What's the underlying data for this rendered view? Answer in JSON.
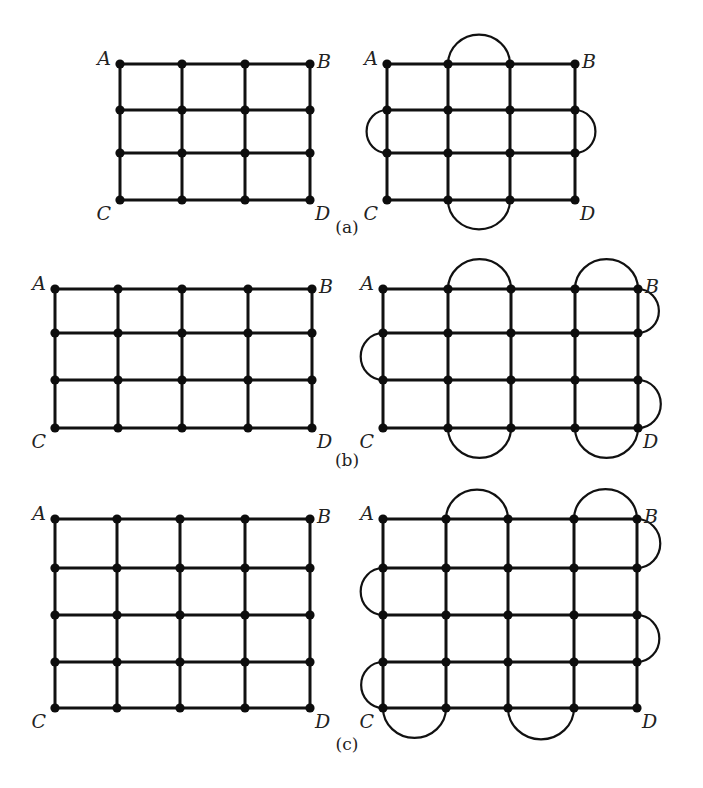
{
  "figure": {
    "diagrams": [
      {
        "id": "a",
        "caption": "(a)",
        "caption_pos": [
          347,
          233
        ],
        "grids": [
          {
            "side": "left",
            "xs": [
              120,
              182,
              245,
              310
            ],
            "ys": [
              64,
              110,
              153,
              200
            ],
            "labels": {
              "A": "A",
              "B": "B",
              "C": "C",
              "D": "D"
            },
            "arcs": []
          },
          {
            "side": "right",
            "xs": [
              387,
              448,
              510,
              575
            ],
            "ys": [
              64,
              110,
              153,
              200
            ],
            "labels": {
              "A": "A",
              "B": "B",
              "C": "C",
              "D": "D"
            },
            "arcs": [
              {
                "dir": "top",
                "row": 0,
                "from": 1,
                "to": 2
              },
              {
                "dir": "left",
                "col": 0,
                "from": 1,
                "to": 2
              },
              {
                "dir": "right",
                "col": 3,
                "from": 1,
                "to": 2
              },
              {
                "dir": "bottom",
                "row": 3,
                "from": 1,
                "to": 2
              }
            ]
          }
        ]
      },
      {
        "id": "b",
        "caption": "(b)",
        "caption_pos": [
          347,
          466
        ],
        "grids": [
          {
            "side": "left",
            "xs": [
              55,
              118,
              182,
              248,
              312
            ],
            "ys": [
              289,
              333,
              380,
              428
            ],
            "labels": {
              "A": "A",
              "B": "B",
              "C": "C",
              "D": "D"
            },
            "arcs": []
          },
          {
            "side": "right",
            "xs": [
              383,
              448,
              511,
              575,
              638
            ],
            "ys": [
              289,
              333,
              380,
              428
            ],
            "labels": {
              "A": "A",
              "B": "B",
              "C": "C",
              "D": "D"
            },
            "arcs": [
              {
                "dir": "top",
                "row": 0,
                "from": 1,
                "to": 2
              },
              {
                "dir": "top",
                "row": 0,
                "from": 3,
                "to": 4
              },
              {
                "dir": "left",
                "col": 0,
                "from": 1,
                "to": 2
              },
              {
                "dir": "right",
                "col": 4,
                "from": 0,
                "to": 1
              },
              {
                "dir": "right",
                "col": 4,
                "from": 2,
                "to": 3
              },
              {
                "dir": "bottom",
                "row": 3,
                "from": 1,
                "to": 2
              },
              {
                "dir": "bottom",
                "row": 3,
                "from": 3,
                "to": 4
              }
            ]
          }
        ]
      },
      {
        "id": "c",
        "caption": "(c)",
        "caption_pos": [
          347,
          750
        ],
        "grids": [
          {
            "side": "left",
            "xs": [
              55,
              117,
              180,
              245,
              310
            ],
            "ys": [
              519,
              568,
              615,
              662,
              708
            ],
            "labels": {
              "A": "A",
              "B": "B",
              "C": "C",
              "D": "D"
            },
            "arcs": []
          },
          {
            "side": "right",
            "xs": [
              383,
              446,
              508,
              574,
              637
            ],
            "ys": [
              519,
              568,
              615,
              662,
              708
            ],
            "labels": {
              "A": "A",
              "B": "B",
              "C": "C",
              "D": "D"
            },
            "arcs": [
              {
                "dir": "top",
                "row": 0,
                "from": 1,
                "to": 2
              },
              {
                "dir": "top",
                "row": 0,
                "from": 3,
                "to": 4
              },
              {
                "dir": "right",
                "col": 4,
                "from": 0,
                "to": 1
              },
              {
                "dir": "left",
                "col": 0,
                "from": 1,
                "to": 2
              },
              {
                "dir": "right",
                "col": 4,
                "from": 2,
                "to": 3
              },
              {
                "dir": "left",
                "col": 0,
                "from": 3,
                "to": 4
              },
              {
                "dir": "bottom",
                "row": 4,
                "from": 0,
                "to": 1
              },
              {
                "dir": "bottom",
                "row": 4,
                "from": 2,
                "to": 3
              }
            ]
          }
        ]
      }
    ],
    "colors": {
      "ink": "#111111",
      "background": "#ffffff"
    }
  }
}
